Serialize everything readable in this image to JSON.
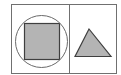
{
  "diagram": {
    "colors": {
      "background": "#ffffff",
      "frame_stroke": "#707070",
      "shape_stroke": "#4a4a4a",
      "circle_stroke": "#6a6a6a",
      "shape_fill": "#b4b4b4"
    },
    "panels": [
      {
        "name": "left",
        "shapes": [
          {
            "type": "circle",
            "cx": 41,
            "cy": 41,
            "r": 26,
            "filled": false
          },
          {
            "type": "square",
            "x": 24,
            "y": 23,
            "width": 35,
            "height": 36,
            "filled": true
          }
        ]
      },
      {
        "name": "right",
        "shapes": [
          {
            "type": "triangle",
            "points": [
              [
                89,
                29
              ],
              [
                75,
                56
              ],
              [
                111,
                56
              ]
            ],
            "filled": true
          }
        ]
      }
    ]
  }
}
